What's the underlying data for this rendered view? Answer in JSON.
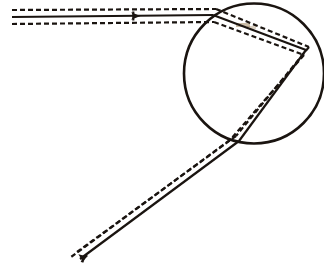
{
  "figure": {
    "title": "Ray path through circular lens",
    "caption": "Optical ray diagram: incident horizontal beam refracts at a circular boundary and exits toward the lower left",
    "background_color": "#ffffff",
    "ink_color": "#1a1410",
    "tint_color": "#8a6a3a",
    "width": 324,
    "height": 277
  },
  "circle": {
    "name": "circular-boundary",
    "cx": 254,
    "cy": 73.5,
    "r": 70,
    "stroke_width": 2.6,
    "stroke_color": "#1a1410",
    "fill": "none"
  },
  "vertices": {
    "incident_start": {
      "x": 12,
      "y": 17
    },
    "entry_point": {
      "x": 213,
      "y": 15
    },
    "apex_right": {
      "x": 306,
      "y": 50
    },
    "exit_point": {
      "x": 239,
      "y": 141
    },
    "ray_end": {
      "x": 80,
      "y": 259
    }
  },
  "rays": {
    "solid": {
      "name": "principal-ray",
      "stroke_width": 2.2,
      "stroke_color": "#1a1410",
      "segments": [
        {
          "label": "incident-horizontal",
          "x1": 12,
          "y1": 17,
          "x2": 213,
          "y2": 15
        },
        {
          "label": "chord-to-apex",
          "x1": 213,
          "y1": 15,
          "x2": 306,
          "y2": 50
        },
        {
          "label": "apex-to-exit",
          "x1": 306,
          "y1": 50,
          "x2": 239,
          "y2": 141
        },
        {
          "label": "emergent-diagonal",
          "x1": 239,
          "y1": 141,
          "x2": 80,
          "y2": 259
        }
      ]
    },
    "dashed_upper": {
      "name": "upper-envelope-ray",
      "stroke_width": 2.2,
      "stroke_color": "#1a1410",
      "dash_pattern": "5 3",
      "segments": [
        {
          "label": "incident-horizontal",
          "x1": 12,
          "y1": 10,
          "x2": 216,
          "y2": 9
        },
        {
          "label": "chord-to-apex",
          "x1": 216,
          "y1": 9,
          "x2": 309,
          "y2": 47
        },
        {
          "label": "apex-to-exit",
          "x1": 309,
          "y1": 47,
          "x2": 236,
          "y2": 136
        },
        {
          "label": "emergent-diagonal",
          "x1": 236,
          "y1": 136,
          "x2": 77,
          "y2": 252
        }
      ]
    },
    "dashed_lower": {
      "name": "lower-envelope-ray",
      "stroke_width": 2.2,
      "stroke_color": "#1a1410",
      "dash_pattern": "5 3",
      "segments": [
        {
          "label": "incident-horizontal",
          "x1": 12,
          "y1": 24,
          "x2": 214,
          "y2": 22
        },
        {
          "label": "chord-to-apex",
          "x1": 214,
          "y1": 22,
          "x2": 304,
          "y2": 55
        },
        {
          "label": "apex-to-exit",
          "x1": 304,
          "y1": 55,
          "x2": 230,
          "y2": 140
        },
        {
          "label": "emergent-diagonal",
          "x1": 230,
          "y1": 140,
          "x2": 71,
          "y2": 257
        }
      ]
    }
  },
  "markers": [
    {
      "name": "incident-direction-arrow",
      "x": 136,
      "y": 16,
      "angle": 0,
      "size": 9
    },
    {
      "name": "emergent-direction-arrow",
      "x": 82,
      "y": 257,
      "angle": 216,
      "size": 9
    }
  ],
  "tint_patches": [
    {
      "name": "paper-tint-upper",
      "x": 236,
      "y": 23,
      "width": 14,
      "height": 4,
      "opacity": 0.45
    },
    {
      "name": "paper-tint-lower",
      "x": 247,
      "y": 26,
      "width": 9,
      "height": 3,
      "opacity": 0.3
    }
  ]
}
